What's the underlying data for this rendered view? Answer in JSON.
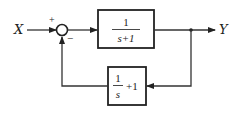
{
  "diagram": {
    "type": "feedback-control-block-diagram",
    "input_label": "X",
    "output_label": "Y",
    "summing_junction": {
      "plus_sign": "+",
      "minus_sign": "−"
    },
    "forward_block": {
      "numerator": "1",
      "denominator": "s+1"
    },
    "feedback_block": {
      "numerator": "1",
      "denominator": "s",
      "suffix": "+1"
    },
    "colors": {
      "line": "#333333",
      "background": "#ffffff"
    }
  }
}
